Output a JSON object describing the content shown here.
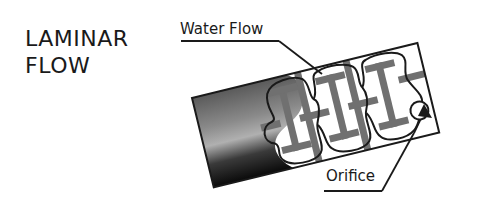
{
  "title": {
    "line1": "LAMINAR",
    "line2": "FLOW"
  },
  "labels": {
    "water_flow": "Water Flow",
    "orifice": "Orifice"
  },
  "colors": {
    "ink": "#1a1a1a",
    "teeth": "#707070",
    "background": "#ffffff"
  }
}
